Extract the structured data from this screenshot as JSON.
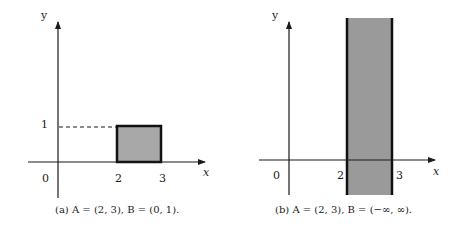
{
  "panels": [
    {
      "id": "a",
      "caption": "(a) A = (2, 3), B = (0, 1).",
      "axis_labels": {
        "x": "x",
        "y": "y"
      },
      "ticks": {
        "origin": "0",
        "x": [
          "2",
          "3"
        ],
        "y": [
          "1"
        ]
      },
      "region": {
        "x_range": [
          2,
          3
        ],
        "y_range": [
          0,
          1
        ],
        "fill": "#a8a8a8",
        "stroke": "#111111"
      },
      "guide": "dashed line at y = 1"
    },
    {
      "id": "b",
      "caption": "(b) A = (2, 3), B = (−∞, ∞).",
      "axis_labels": {
        "x": "x",
        "y": "y"
      },
      "ticks": {
        "origin": "0",
        "x": [
          "2",
          "3"
        ],
        "y": []
      },
      "region": {
        "x_range": [
          2,
          3
        ],
        "y_range": [
          "-inf",
          "inf"
        ],
        "fill": "#9a9a9a",
        "stroke": "#111111"
      }
    }
  ],
  "labels": {
    "a_y": "y",
    "a_x": "x",
    "a_one": "1",
    "a_zero": "0",
    "a_two": "2",
    "a_three": "3",
    "b_y": "y",
    "b_x": "x",
    "b_zero": "0",
    "b_two": "2",
    "b_three": "3"
  }
}
